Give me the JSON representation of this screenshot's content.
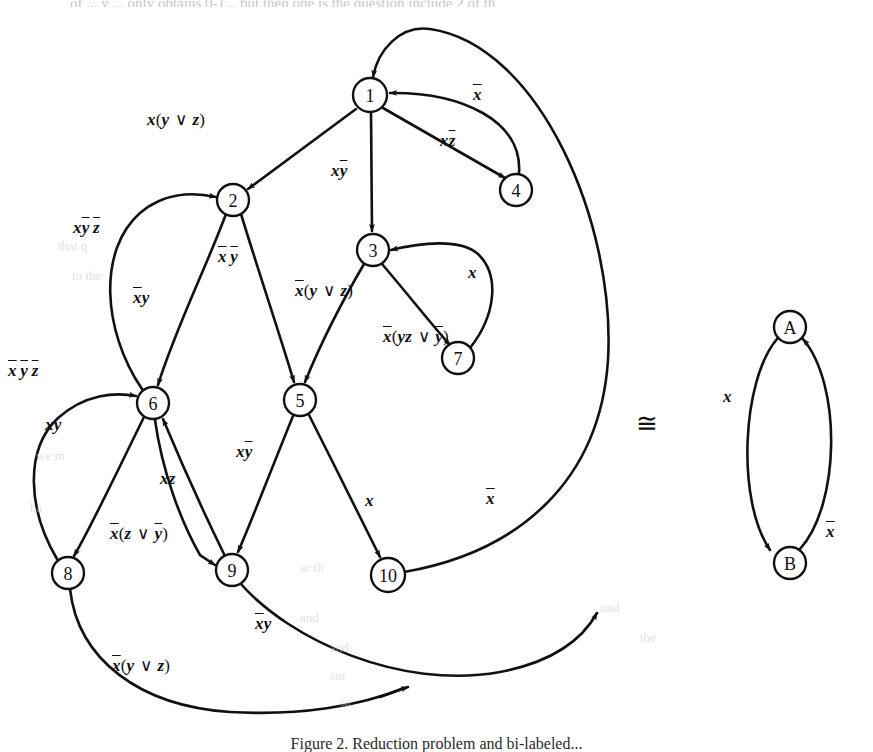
{
  "figure": {
    "caption": "Figure 2. Reduction problem and bi-labeled...",
    "top_cut_text": "of ...   y ... only obtains 0-1...  but then one is the question include 2 of th",
    "congruent_symbol": "≅"
  },
  "left_graph": {
    "name": "reduction-graph",
    "nodes": [
      {
        "id": "1",
        "label": "1",
        "cx": 370,
        "cy": 95,
        "r": 17
      },
      {
        "id": "2",
        "label": "2",
        "cx": 233,
        "cy": 200,
        "r": 16
      },
      {
        "id": "3",
        "label": "3",
        "cx": 373,
        "cy": 250,
        "r": 16
      },
      {
        "id": "4",
        "label": "4",
        "cx": 516,
        "cy": 190,
        "r": 16
      },
      {
        "id": "5",
        "label": "5",
        "cx": 300,
        "cy": 400,
        "r": 16
      },
      {
        "id": "6",
        "label": "6",
        "cx": 153,
        "cy": 403,
        "r": 16
      },
      {
        "id": "7",
        "label": "7",
        "cx": 458,
        "cy": 358,
        "r": 16
      },
      {
        "id": "8",
        "label": "8",
        "cx": 68,
        "cy": 573,
        "r": 16
      },
      {
        "id": "9",
        "label": "9",
        "cx": 232,
        "cy": 570,
        "r": 16
      },
      {
        "id": "10",
        "label": "10",
        "cx": 388,
        "cy": 575,
        "r": 17
      }
    ],
    "edges": [
      {
        "from": "1",
        "to": "2",
        "label": "x(y∨z)",
        "label_x": 147,
        "label_y": 120
      },
      {
        "from": "1",
        "to": "3",
        "label": "xȳ",
        "label_x": 331,
        "label_y": 170
      },
      {
        "from": "1",
        "to": "4",
        "label": "xz̄",
        "label_x": 440,
        "label_y": 140
      },
      {
        "from": "4",
        "to": "1",
        "label": "x̄",
        "label_x": 473,
        "label_y": 94
      },
      {
        "from": "2",
        "to": "6",
        "label": "x̄y",
        "label_x": 133,
        "label_y": 297
      },
      {
        "from": "2",
        "to": "5",
        "label": "x̄ȳ",
        "label_x": 218,
        "label_y": 256
      },
      {
        "from": "6",
        "to": "2",
        "label": "xȳz̄",
        "label_x": 73,
        "label_y": 227
      },
      {
        "from": "3",
        "to": "5",
        "label": "x̄(y∨z)",
        "label_x": 295,
        "label_y": 290
      },
      {
        "from": "3",
        "to": "7",
        "label": "x̄(yz∨ȳ)",
        "label_x": 383,
        "label_y": 336
      },
      {
        "from": "7",
        "to": "3",
        "label": "x",
        "label_x": 468,
        "label_y": 272
      },
      {
        "from": "6",
        "to": "8",
        "label": "xy",
        "label_x": 45,
        "label_y": 424
      },
      {
        "from": "8",
        "to": "6",
        "label": "x̄ȳz̄",
        "label_x": 8,
        "label_y": 370
      },
      {
        "from": "9",
        "to": "6",
        "label": "xz",
        "label_x": 160,
        "label_y": 478
      },
      {
        "from": "6",
        "to": "9",
        "label": "x̄(z∨ȳ)",
        "label_x": 110,
        "label_y": 533
      },
      {
        "from": "5",
        "to": "9",
        "label": "xȳ",
        "label_x": 236,
        "label_y": 451
      },
      {
        "from": "5",
        "to": "10",
        "label": "x",
        "label_x": 365,
        "label_y": 500
      },
      {
        "from": "10",
        "to": "1",
        "label": "x̄",
        "label_x": 486,
        "label_y": 498
      },
      {
        "from": "9",
        "to": "1",
        "label": "x̄y",
        "label_x": 255,
        "label_y": 623
      },
      {
        "from": "8",
        "to": "1",
        "label": "x̄(y∨z)",
        "label_x": 112,
        "label_y": 665
      }
    ]
  },
  "right_graph": {
    "name": "two-state-graph",
    "nodes": [
      {
        "id": "A",
        "label": "A",
        "cx": 790,
        "cy": 327,
        "r": 16
      },
      {
        "id": "B",
        "label": "B",
        "cx": 790,
        "cy": 563,
        "r": 16
      }
    ],
    "edges": [
      {
        "from": "A",
        "to": "B",
        "label": "x",
        "label_x": 723,
        "label_y": 396
      },
      {
        "from": "B",
        "to": "A",
        "label": "x̄",
        "label_x": 826,
        "label_y": 531
      }
    ]
  },
  "ghost_text": [
    {
      "text": "that q",
      "x": 58,
      "y": 238,
      "size": 13
    },
    {
      "text": "to the",
      "x": 72,
      "y": 268,
      "size": 13
    },
    {
      "text": "we m",
      "x": 36,
      "y": 448,
      "size": 13
    },
    {
      "text": "ba",
      "x": 30,
      "y": 500,
      "size": 13
    },
    {
      "text": "ar th",
      "x": 300,
      "y": 560,
      "size": 13
    },
    {
      "text": "and",
      "x": 300,
      "y": 610,
      "size": 13
    },
    {
      "text": "and",
      "x": 330,
      "y": 640,
      "size": 13
    },
    {
      "text": "sur",
      "x": 330,
      "y": 668,
      "size": 13
    },
    {
      "text": "sa",
      "x": 340,
      "y": 694,
      "size": 13
    },
    {
      "text": "und",
      "x": 600,
      "y": 600,
      "size": 13
    },
    {
      "text": "the",
      "x": 640,
      "y": 630,
      "size": 13
    }
  ]
}
